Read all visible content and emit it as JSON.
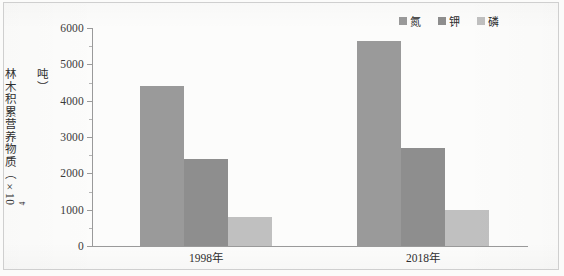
{
  "chart_data": {
    "type": "bar",
    "title": "",
    "xlabel": "",
    "ylabel": "林木积累营养物质（×10⁴吨）",
    "ylabel_parts": {
      "prefix": "林木积累营养物质（×10",
      "exponent": "4",
      "suffix": "吨）"
    },
    "categories": [
      "1998年",
      "2018年"
    ],
    "series": [
      {
        "name": "氮",
        "values": [
          4400,
          5650
        ],
        "color": "#9a9a9a"
      },
      {
        "name": "钾",
        "values": [
          2400,
          2700
        ],
        "color": "#8e8e8e"
      },
      {
        "name": "磷",
        "values": [
          800,
          1000
        ],
        "color": "#c0c0c0"
      }
    ],
    "ylim": [
      0,
      6000
    ],
    "yticks": [
      0,
      1000,
      2000,
      3000,
      4000,
      5000,
      6000
    ],
    "ytick_labels": [
      "0",
      "1000",
      "2000",
      "3000",
      "4000",
      "5000",
      "6000"
    ],
    "minor_tick_step": 500,
    "grid": false,
    "legend_position": "top-right",
    "axis_color": "#9a9a9a",
    "background_color": "#fcfcfb"
  }
}
